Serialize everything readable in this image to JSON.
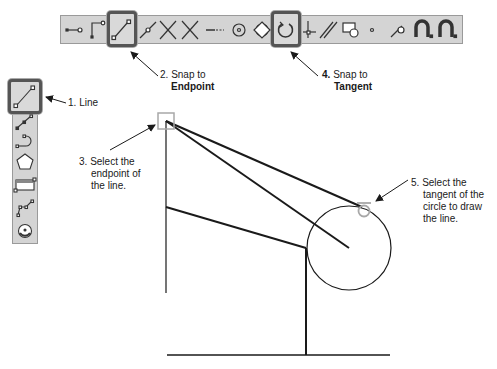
{
  "horizontal_toolbar": {
    "tools": [
      {
        "name": "line-point-icon"
      },
      {
        "name": "corner-icon"
      },
      {
        "name": "endpoint-snap-icon",
        "highlighted": true
      },
      {
        "name": "midpoint-icon"
      },
      {
        "name": "intersection-icon"
      },
      {
        "name": "apparent-intersection-icon"
      },
      {
        "name": "extension-icon"
      },
      {
        "name": "center-icon"
      },
      {
        "name": "quadrant-icon"
      },
      {
        "name": "tangent-snap-icon",
        "highlighted": true
      },
      {
        "name": "perpendicular-icon"
      },
      {
        "name": "parallel-icon"
      },
      {
        "name": "insert-icon"
      },
      {
        "name": "node-icon"
      },
      {
        "name": "nearest-icon"
      },
      {
        "name": "snap-magnet-icon"
      },
      {
        "name": "snap-settings-magnet-icon"
      }
    ]
  },
  "vertical_toolbar": {
    "tools": [
      {
        "name": "line-tool-icon",
        "highlighted": true
      },
      {
        "name": "polyline-icon"
      },
      {
        "name": "arc-icon"
      },
      {
        "name": "polygon-icon"
      },
      {
        "name": "rectangle-icon"
      },
      {
        "name": "spline-icon"
      },
      {
        "name": "circle-icon"
      }
    ]
  },
  "callouts": {
    "step1": {
      "number": "1.",
      "text": "Line"
    },
    "step2": {
      "number": "2.",
      "line1": "Snap to",
      "line2": "Endpoint"
    },
    "step3": {
      "number": "3.",
      "line1": "Select the",
      "line2": "endpoint of",
      "line3": "the line."
    },
    "step4": {
      "number": "4.",
      "line1": "Snap to",
      "line2": "Tangent"
    },
    "step5": {
      "number": "5.",
      "line1": "Select the",
      "line2": "tangent of the",
      "line3": "circle to draw",
      "line4": "the line."
    }
  },
  "colors": {
    "toolbar_bg": "#d4d4d4",
    "highlight_border": "#555555",
    "snap_marker": "#a8a8a8",
    "drawing_line": "#1a1a1a"
  }
}
